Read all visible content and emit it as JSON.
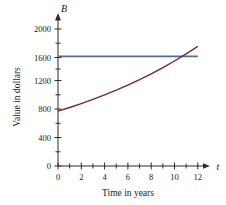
{
  "chart_data": {
    "type": "line",
    "title": "",
    "xlabel": "Time in years",
    "ylabel": "Value in dollars",
    "x_axis_variable": "t",
    "y_axis_variable": "B",
    "xlim": [
      0,
      13
    ],
    "ylim": [
      0,
      2200
    ],
    "grid": false,
    "legend_position": "none",
    "x_tick_labels": [
      "0",
      "2",
      "4",
      "6",
      "8",
      "10",
      "12"
    ],
    "x_tick_values": [
      0,
      2,
      4,
      6,
      8,
      10,
      12
    ],
    "x_minor_tick_values": [
      1,
      3,
      5,
      7,
      9,
      11
    ],
    "y_tick_labels": [
      "0",
      "400",
      "800",
      "1200",
      "1600",
      "2000"
    ],
    "y_tick_values": [
      0,
      400,
      800,
      1200,
      1600,
      2000
    ],
    "y_minor_tick_values": [
      200,
      600,
      1000,
      1400,
      1800
    ],
    "series": [
      {
        "name": "Compound growth investment",
        "color": "#7d2234",
        "x": [
          0,
          1,
          2,
          3,
          4,
          5,
          6,
          7,
          8,
          9,
          10,
          11,
          12
        ],
        "values": [
          800,
          854,
          911,
          972,
          1038,
          1107,
          1182,
          1261,
          1346,
          1436,
          1533,
          1636,
          1746
        ]
      },
      {
        "name": "Constant value",
        "color": "#4a6fa5",
        "x": [
          0,
          12
        ],
        "values": [
          1600,
          1600
        ]
      }
    ],
    "annotations": [
      {
        "text": "curves intersect near t = 10.3, B = 1600",
        "x": 10.3,
        "y": 1600
      }
    ]
  },
  "axis_labels": {
    "y_variable": "B",
    "x_variable": "t",
    "y_title": "Value in dollars",
    "x_title": "Time in years"
  }
}
